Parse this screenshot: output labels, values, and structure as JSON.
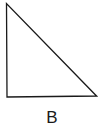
{
  "diagram": {
    "shape": "right-triangle",
    "label": "B",
    "stroke_color": "#1a1a1a",
    "vertices": [
      [
        6,
        3
      ],
      [
        7,
        97
      ],
      [
        97,
        96
      ]
    ]
  }
}
